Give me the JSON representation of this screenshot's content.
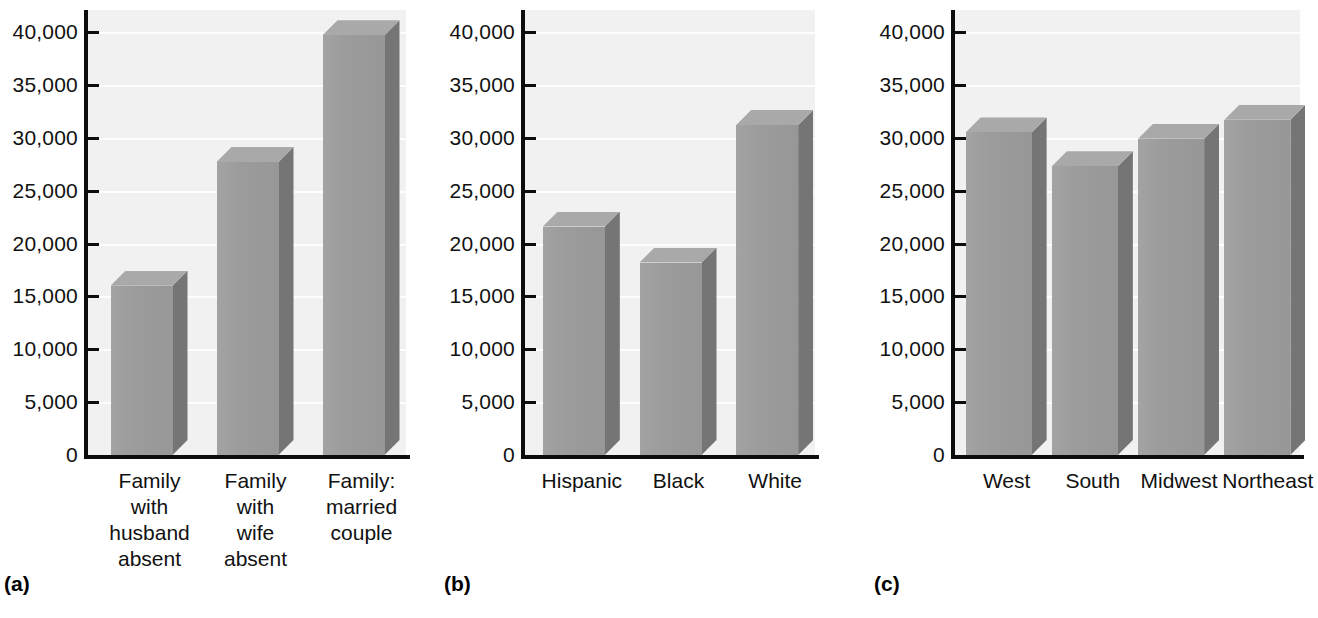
{
  "figure": {
    "background": "#ffffff",
    "plot_background": "#f1f1f1",
    "axis_color": "#0d0d0d",
    "bar_front_color": "#9c9c9c",
    "bar_side_color": "#757575",
    "bar_top_color": "#a9a9a9"
  },
  "chart_data": [
    {
      "type": "bar",
      "panel": "(a)",
      "title": "",
      "xlabel": "",
      "ylabel": "",
      "categories": [
        "Family with husband absent",
        "Family with wife absent",
        "Family: married couple"
      ],
      "category_lines": [
        [
          "Family",
          "with",
          "husband",
          "absent"
        ],
        [
          "Family",
          "with",
          "wife",
          "absent"
        ],
        [
          "Family:",
          "married",
          "couple"
        ]
      ],
      "values": [
        16000,
        27700,
        39700
      ],
      "ylim": [
        0,
        40000
      ],
      "ytick_values": [
        0,
        5000,
        10000,
        15000,
        20000,
        25000,
        30000,
        35000,
        40000
      ],
      "yticks": [
        "0",
        "5,000",
        "10,000",
        "15,000",
        "20,000",
        "25,000",
        "30,000",
        "35,000",
        "40,000"
      ],
      "grid": true,
      "legend": "none"
    },
    {
      "type": "bar",
      "panel": "(b)",
      "title": "",
      "xlabel": "",
      "ylabel": "",
      "categories": [
        "Hispanic",
        "Black",
        "White"
      ],
      "category_lines": [
        [
          "Hispanic"
        ],
        [
          "Black"
        ],
        [
          "White"
        ]
      ],
      "values": [
        21600,
        18200,
        31200
      ],
      "ylim": [
        0,
        40000
      ],
      "ytick_values": [
        0,
        5000,
        10000,
        15000,
        20000,
        25000,
        30000,
        35000,
        40000
      ],
      "yticks": [
        "0",
        "5,000",
        "10,000",
        "15,000",
        "20,000",
        "25,000",
        "30,000",
        "35,000",
        "40,000"
      ],
      "grid": true,
      "legend": "none"
    },
    {
      "type": "bar",
      "panel": "(c)",
      "title": "",
      "xlabel": "",
      "ylabel": "",
      "categories": [
        "West",
        "South",
        "Midwest",
        "Northeast"
      ],
      "category_lines": [
        [
          "West"
        ],
        [
          "South"
        ],
        [
          "Midwest"
        ],
        [
          "Northeast"
        ]
      ],
      "values": [
        30500,
        27300,
        29900,
        31700
      ],
      "ylim": [
        0,
        40000
      ],
      "ytick_values": [
        0,
        5000,
        10000,
        15000,
        20000,
        25000,
        30000,
        35000,
        40000
      ],
      "yticks": [
        "0",
        "5,000",
        "10,000",
        "15,000",
        "20,000",
        "25,000",
        "30,000",
        "35,000",
        "40,000"
      ],
      "grid": true,
      "legend": "none"
    }
  ],
  "panels": [
    {
      "tag": "(a)"
    },
    {
      "tag": "(b)"
    },
    {
      "tag": "(c)"
    }
  ]
}
